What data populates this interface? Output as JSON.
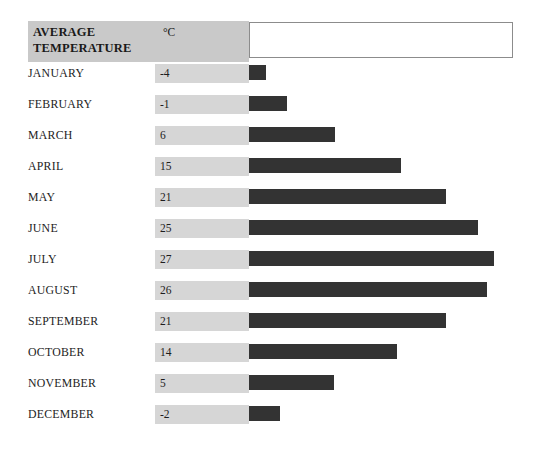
{
  "header": {
    "title": "AVERAGE\nTEMPERATURE",
    "unit": "°C",
    "value_box_text": ""
  },
  "colors": {
    "header_band": "#c9c9c9",
    "value_band": "#d6d6d6",
    "bar": "#333333",
    "background": "#ffffff",
    "box_border": "#8c8c8c",
    "text": "#1d1d1d"
  },
  "chart_data": {
    "type": "bar",
    "title": "AVERAGE TEMPERATURE",
    "xlabel": "",
    "ylabel": "",
    "unit": "°C",
    "orientation": "horizontal",
    "grid": false,
    "legend": "none",
    "categories": [
      "JANUARY",
      "FEBRUARY",
      "MARCH",
      "APRIL",
      "MAY",
      "JUNE",
      "JULY",
      "AUGUST",
      "SEPTEMBER",
      "OCTOBER",
      "NOVEMBER",
      "DECEMBER"
    ],
    "values": [
      -4,
      -1,
      6,
      15,
      21,
      25,
      27,
      26,
      21,
      14,
      5,
      -2
    ],
    "value_labels": [
      "-4",
      "-1",
      "6",
      "15",
      "21",
      "25",
      "27",
      "26",
      "21",
      "14",
      "5",
      "-2"
    ],
    "bar_px_widths": [
      17,
      38,
      86,
      152,
      197,
      229,
      245,
      238,
      197,
      148,
      85,
      31
    ],
    "xlim": [
      -4,
      27
    ]
  },
  "rows": [
    {
      "month": "JANUARY",
      "value": "-4",
      "bar_px": 17,
      "top": 62
    },
    {
      "month": "FEBRUARY",
      "value": "-1",
      "bar_px": 38,
      "top": 93
    },
    {
      "month": "MARCH",
      "value": "6",
      "bar_px": 86,
      "top": 124
    },
    {
      "month": "APRIL",
      "value": "15",
      "bar_px": 152,
      "top": 155
    },
    {
      "month": "MAY",
      "value": "21",
      "bar_px": 197,
      "top": 186
    },
    {
      "month": "JUNE",
      "value": "25",
      "bar_px": 229,
      "top": 217
    },
    {
      "month": "JULY",
      "value": "27",
      "bar_px": 245,
      "top": 248
    },
    {
      "month": "AUGUST",
      "value": "26",
      "bar_px": 238,
      "top": 279
    },
    {
      "month": "SEPTEMBER",
      "value": "21",
      "bar_px": 197,
      "top": 310
    },
    {
      "month": "OCTOBER",
      "value": "14",
      "bar_px": 148,
      "top": 341
    },
    {
      "month": "NOVEMBER",
      "value": "5",
      "bar_px": 85,
      "top": 372
    },
    {
      "month": "DECEMBER",
      "value": "-2",
      "bar_px": 31,
      "top": 403
    }
  ]
}
